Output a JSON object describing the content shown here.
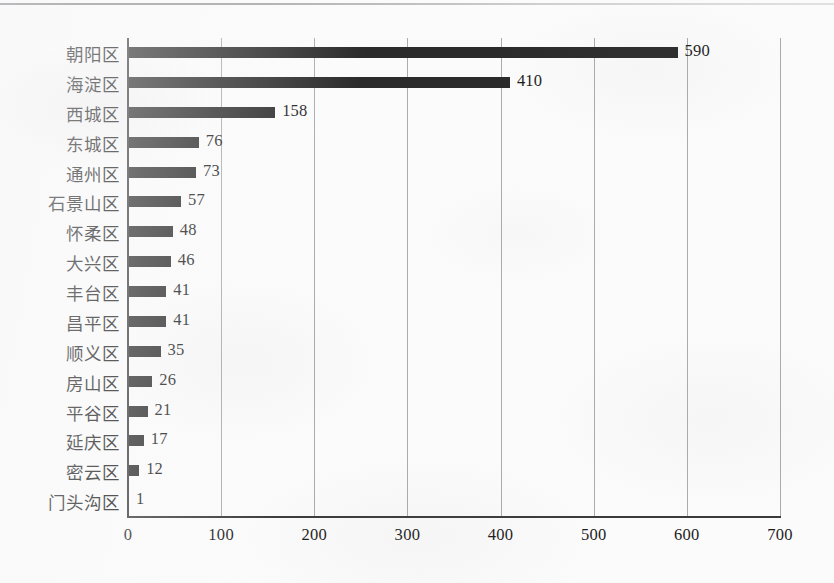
{
  "chart_data": {
    "type": "bar",
    "orientation": "horizontal",
    "title": "",
    "subtitle": "",
    "xlabel": "",
    "ylabel": "",
    "xlim": [
      0,
      700
    ],
    "xticks": [
      "0",
      "100",
      "200",
      "300",
      "400",
      "500",
      "600",
      "700"
    ],
    "grid": "vertical",
    "legend": "none",
    "bar_color": "#2b2b2b",
    "background_color": "#fbfbfb",
    "axis_color": "#3b3b3b",
    "categories": [
      "朝阳区",
      "海淀区",
      "西城区",
      "东城区",
      "通州区",
      "石景山区",
      "怀柔区",
      "大兴区",
      "丰台区",
      "昌平区",
      "顺义区",
      "房山区",
      "平谷区",
      "延庆区",
      "密云区",
      "门头沟区"
    ],
    "values": [
      590,
      410,
      158,
      76,
      73,
      57,
      48,
      46,
      41,
      41,
      35,
      26,
      21,
      17,
      12,
      1
    ],
    "data_labels": [
      "590",
      "410",
      "158",
      "76",
      "73",
      "57",
      "48",
      "46",
      "41",
      "41",
      "35",
      "26",
      "21",
      "17",
      "12",
      "1"
    ]
  }
}
